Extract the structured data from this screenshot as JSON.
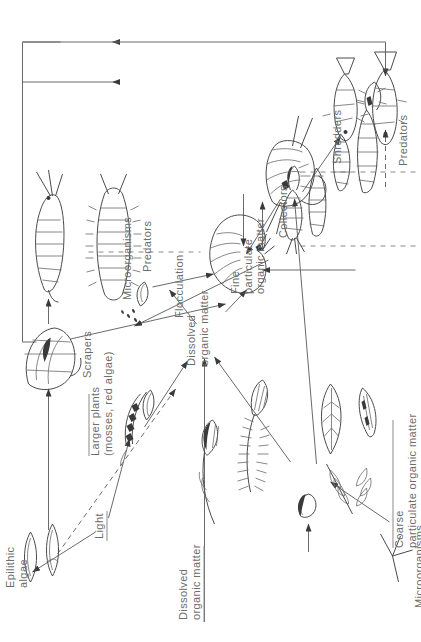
{
  "diagram": {
    "orientation": "rotated-90",
    "labels": {
      "light": "Light",
      "epilithic_algae": "Epilithic\nalgae",
      "larger_plants": "Larger plants\n(mosses, red algae)",
      "dissolved_organic_matter_left": "Dissolved\norganic matter",
      "dissolved_organic_matter_mid": "Dissolved\norganic matter",
      "fine_particulate_organic_matter": "Fine\nparticulate\norganic matter",
      "coarse_particulate_organic_matter": "Coarse\nparticulate organic matter",
      "flocculation": "Flocculation",
      "microorganisms": "Microorganisms",
      "microorganisms_fungi": "Microorganisms,\ne.g. Hyphomycete fungi",
      "scrapers": "Scrapers",
      "shredders": "Shredders",
      "collectors": "Collectors",
      "predators_invertebrate": "Predators",
      "predators_fish": "Predators"
    },
    "colors": {
      "text": "#6d6d6d",
      "line": "#6a6a6a",
      "ink": "#3a3a3a",
      "background": "#ffffff"
    },
    "nodes": [
      {
        "id": "light",
        "label": "Light",
        "type": "energy-source"
      },
      {
        "id": "epilithic-algae",
        "label": "Epilithic algae",
        "type": "producer"
      },
      {
        "id": "larger-plants",
        "label": "Larger plants (mosses, red algae)",
        "type": "producer"
      },
      {
        "id": "dom-left",
        "label": "Dissolved organic matter",
        "type": "resource"
      },
      {
        "id": "dom-mid",
        "label": "Dissolved organic matter",
        "type": "resource"
      },
      {
        "id": "fpom",
        "label": "Fine particulate organic matter",
        "type": "resource"
      },
      {
        "id": "cpom",
        "label": "Coarse particulate organic matter",
        "type": "resource"
      },
      {
        "id": "flocculation",
        "label": "Flocculation",
        "type": "process"
      },
      {
        "id": "microorganisms",
        "label": "Microorganisms",
        "type": "decomposer"
      },
      {
        "id": "hyphomycete-fungi",
        "label": "Microorganisms, e.g. Hyphomycete fungi",
        "type": "decomposer"
      },
      {
        "id": "scrapers",
        "label": "Scrapers",
        "type": "feeding-group"
      },
      {
        "id": "shredders",
        "label": "Shredders",
        "type": "feeding-group"
      },
      {
        "id": "collectors",
        "label": "Collectors",
        "type": "feeding-group"
      },
      {
        "id": "predators-invertebrate",
        "label": "Predators",
        "type": "feeding-group"
      },
      {
        "id": "predators-fish",
        "label": "Predators",
        "type": "feeding-group"
      }
    ],
    "edges": [
      {
        "from": "light",
        "to": "epilithic-algae",
        "style": "solid"
      },
      {
        "from": "light",
        "to": "larger-plants",
        "style": "solid"
      },
      {
        "from": "epilithic-algae",
        "to": "dom-mid",
        "style": "dashed"
      },
      {
        "from": "epilithic-algae",
        "to": "scrapers",
        "style": "solid"
      },
      {
        "from": "larger-plants",
        "to": "dom-mid",
        "style": "solid"
      },
      {
        "from": "dom-left",
        "to": "dom-mid",
        "style": "solid"
      },
      {
        "from": "dom-mid",
        "to": "flocculation",
        "style": "solid"
      },
      {
        "from": "flocculation",
        "to": "fpom",
        "style": "solid"
      },
      {
        "from": "microorganisms",
        "to": "fpom",
        "style": "solid"
      },
      {
        "from": "cpom",
        "to": "shredders",
        "style": "solid"
      },
      {
        "from": "hyphomycete-fungi",
        "to": "cpom",
        "style": "solid"
      },
      {
        "from": "scrapers",
        "to": "fpom",
        "style": "solid"
      },
      {
        "from": "scrapers",
        "to": "predators-invertebrate",
        "style": "solid"
      },
      {
        "from": "shredders",
        "to": "fpom",
        "style": "solid"
      },
      {
        "from": "shredders",
        "to": "predators-fish",
        "style": "dashed"
      },
      {
        "from": "shredders",
        "to": "predators-invertebrate",
        "style": "solid"
      },
      {
        "from": "fpom",
        "to": "collectors",
        "style": "solid"
      },
      {
        "from": "collectors",
        "to": "predators-invertebrate",
        "style": "solid"
      },
      {
        "from": "predators-invertebrate",
        "to": "predators-fish",
        "style": "solid"
      }
    ]
  }
}
